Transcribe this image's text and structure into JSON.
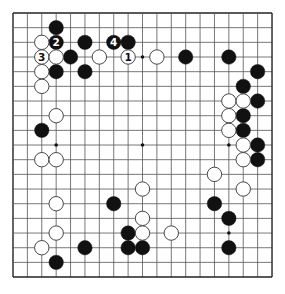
{
  "board": {
    "size": 19,
    "origin_x": 13,
    "origin_y": 13,
    "spacing_x": 14.39,
    "spacing_y": 14.67,
    "stone_radius": 7.2,
    "line_color": "#555555",
    "edge_color": "#222222",
    "star_points": [
      [
        3,
        3
      ],
      [
        3,
        9
      ],
      [
        3,
        15
      ],
      [
        9,
        3
      ],
      [
        9,
        9
      ],
      [
        9,
        15
      ],
      [
        15,
        3
      ],
      [
        15,
        9
      ],
      [
        15,
        15
      ]
    ]
  },
  "stones": {
    "black": [
      {
        "row": 1,
        "col": 3
      },
      {
        "row": 2,
        "col": 3,
        "label": "2"
      },
      {
        "row": 2,
        "col": 5
      },
      {
        "row": 2,
        "col": 7,
        "label": "4"
      },
      {
        "row": 2,
        "col": 8
      },
      {
        "row": 3,
        "col": 4
      },
      {
        "row": 3,
        "col": 12
      },
      {
        "row": 3,
        "col": 15
      },
      {
        "row": 4,
        "col": 3
      },
      {
        "row": 4,
        "col": 5
      },
      {
        "row": 4,
        "col": 17
      },
      {
        "row": 5,
        "col": 16
      },
      {
        "row": 6,
        "col": 17
      },
      {
        "row": 7,
        "col": 16
      },
      {
        "row": 8,
        "col": 16
      },
      {
        "row": 8,
        "col": 2
      },
      {
        "row": 9,
        "col": 17
      },
      {
        "row": 10,
        "col": 17
      },
      {
        "row": 13,
        "col": 7
      },
      {
        "row": 13,
        "col": 14
      },
      {
        "row": 14,
        "col": 15
      },
      {
        "row": 15,
        "col": 8
      },
      {
        "row": 16,
        "col": 5
      },
      {
        "row": 16,
        "col": 8
      },
      {
        "row": 16,
        "col": 9
      },
      {
        "row": 16,
        "col": 15
      },
      {
        "row": 17,
        "col": 3
      }
    ],
    "white": [
      {
        "row": 2,
        "col": 2
      },
      {
        "row": 3,
        "col": 2,
        "label": "3"
      },
      {
        "row": 3,
        "col": 3
      },
      {
        "row": 3,
        "col": 6
      },
      {
        "row": 3,
        "col": 8,
        "label": "1"
      },
      {
        "row": 3,
        "col": 10
      },
      {
        "row": 4,
        "col": 2
      },
      {
        "row": 5,
        "col": 2
      },
      {
        "row": 6,
        "col": 15
      },
      {
        "row": 6,
        "col": 16
      },
      {
        "row": 7,
        "col": 3
      },
      {
        "row": 7,
        "col": 15
      },
      {
        "row": 8,
        "col": 15
      },
      {
        "row": 9,
        "col": 16
      },
      {
        "row": 10,
        "col": 2
      },
      {
        "row": 10,
        "col": 3
      },
      {
        "row": 10,
        "col": 16
      },
      {
        "row": 11,
        "col": 14
      },
      {
        "row": 12,
        "col": 9
      },
      {
        "row": 12,
        "col": 16
      },
      {
        "row": 13,
        "col": 3
      },
      {
        "row": 14,
        "col": 9
      },
      {
        "row": 15,
        "col": 3
      },
      {
        "row": 15,
        "col": 9
      },
      {
        "row": 15,
        "col": 11
      },
      {
        "row": 16,
        "col": 2
      }
    ]
  },
  "colors": {
    "black_stone": "#111111",
    "white_stone": "#ffffff",
    "white_stone_border": "#333333",
    "label_on_black": "#ffffff",
    "label_on_white": "#111111"
  }
}
